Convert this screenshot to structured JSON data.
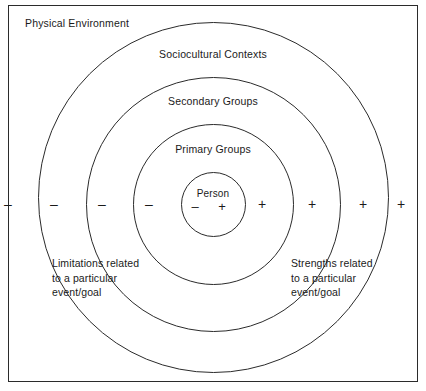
{
  "diagram": {
    "frame_label": "Physical Environment",
    "rings": [
      {
        "name": "physical-environment",
        "label": "Physical Environment"
      },
      {
        "name": "sociocultural-contexts",
        "label": "Sociocultural Contexts"
      },
      {
        "name": "secondary-groups",
        "label": "Secondary Groups"
      },
      {
        "name": "primary-groups",
        "label": "Primary Groups"
      },
      {
        "name": "person",
        "label": "Person"
      }
    ],
    "labels": {
      "sociocultural": "Sociocultural Contexts",
      "secondary": "Secondary Groups",
      "primary": "Primary Groups",
      "person": "Person"
    },
    "signs": {
      "minus": "–",
      "plus": "+",
      "left_minus_count": 4,
      "right_plus_count": 4,
      "center_minus": "–",
      "center_plus": "+"
    },
    "annotations": {
      "left": "Limitations related\nto a particular\nevent/goal",
      "right": "Strengths related\nto a particular\nevent/goal"
    },
    "colors": {
      "stroke": "#2b2b2b",
      "text": "#1a1a1a",
      "background": "#ffffff"
    }
  }
}
